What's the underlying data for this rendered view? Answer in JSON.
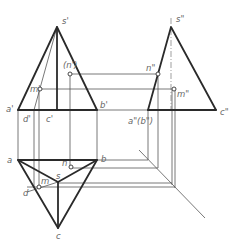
{
  "figure": {
    "type": "orthographic-projection",
    "views": [
      "front",
      "side",
      "top"
    ]
  },
  "labels": {
    "front": {
      "apex": "s'",
      "a": "a'",
      "b": "b'",
      "c": "c'",
      "d": "d'",
      "m": "m'",
      "n": "(n')"
    },
    "side": {
      "apex": "s\"",
      "ab": "a\"(b\")",
      "c": "c\"",
      "m": "m\"",
      "n": "n\""
    },
    "top": {
      "a": "a",
      "b": "b",
      "c": "c",
      "s": "s",
      "d": "d",
      "m": "m",
      "n": "n"
    }
  },
  "colors": {
    "outline": "#2a2a2a",
    "projection_line": "#555555",
    "label": "#666666"
  }
}
